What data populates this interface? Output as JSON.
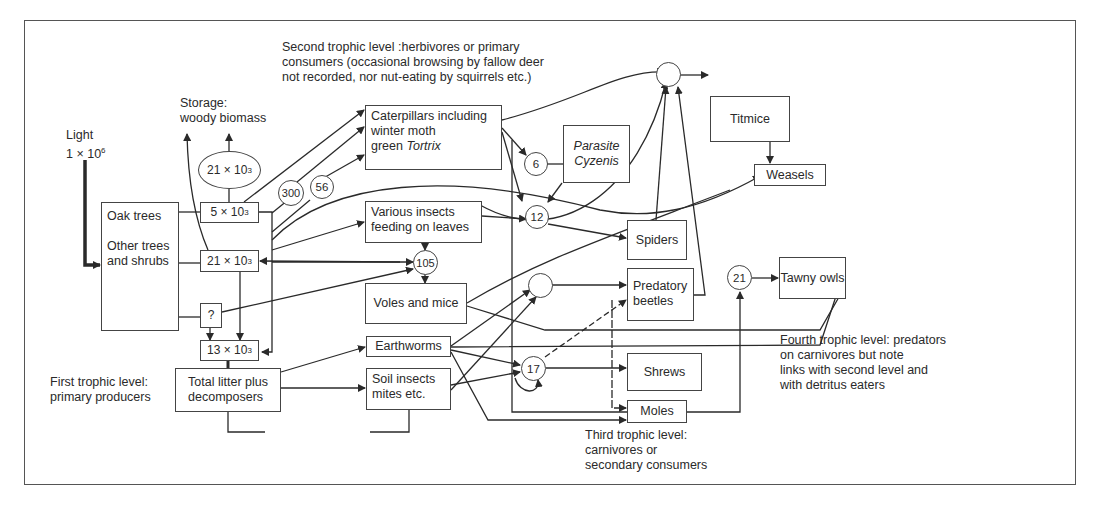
{
  "labels": {
    "light_title": "Light",
    "light_value": "1 × 10",
    "light_exp": "6",
    "storage_line1": "Storage:",
    "storage_line2": "woody biomass",
    "second_level": "Second trophic level :herbivores or primary\nconsumers (occasional browsing by fallow deer\nnot recorded, nor nut-eating by squirrels etc.)",
    "first_level": "First trophic level:\nprimary producers",
    "third_level": "Third trophic level:\ncarnivores or\nsecondary consumers",
    "fourth_level": "Fourth trophic level: predators\non carnivores but note\nlinks with second level and\nwith detritus eaters"
  },
  "producers": {
    "oak_trees": "Oak trees",
    "other_trees": "Other trees\nand shrubs",
    "litter": "Total litter plus\ndecomposers"
  },
  "pools": {
    "oak_pool": {
      "base": "5 × 10",
      "exp": "3"
    },
    "storage_oval": {
      "base": "21 × 10",
      "exp": "3"
    },
    "other_pool": {
      "base": "21 × 10",
      "exp": "3"
    },
    "unknown_pool": "?",
    "litter_pool": {
      "base": "13 × 10",
      "exp": "3"
    }
  },
  "consumers": {
    "caterpillars_line1": "Caterpillars including",
    "caterpillars_line2": "winter moth",
    "caterpillars_line3a": "green ",
    "caterpillars_line3b": "Tortrix",
    "parasite": "Parasite\nCyzenis",
    "various_insects": "Various insects\nfeeding on leaves",
    "voles": "Voles and mice",
    "earthworms": "Earthworms",
    "soil_insects": "Soil insects\nmites etc.",
    "titmice": "Titmice",
    "weasels": "Weasels",
    "spiders": "Spiders",
    "predatory_beetles": "Predatory\nbeetles",
    "shrews": "Shrews",
    "moles": "Moles",
    "tawny_owls": "Tawny owls"
  },
  "flow_values": {
    "n300": "300",
    "n56": "56",
    "n6": "6",
    "n12": "12",
    "n105": "105",
    "n17": "17",
    "n21": "21",
    "titmice_node": "",
    "beetles_node": ""
  },
  "colors": {
    "line": "#2a2a2a",
    "background": "#ffffff"
  }
}
